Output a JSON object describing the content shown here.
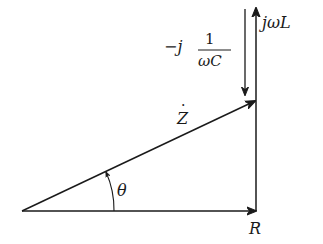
{
  "diagram": {
    "vectors": [
      {
        "id": "R",
        "label": "R",
        "description": "resistance along real axis"
      },
      {
        "id": "jwL",
        "label": "jωL",
        "description": "inductive reactance, upward"
      },
      {
        "id": "negj_wC",
        "label_prefix": "−j",
        "label_num": "1",
        "label_den": "ωC",
        "description": "capacitive reactance, downward"
      },
      {
        "id": "Z",
        "label": "Z",
        "label_accent": "·",
        "description": "impedance phasor (hypotenuse)"
      }
    ],
    "angle": {
      "label": "θ",
      "description": "impedance angle between R and Z"
    }
  }
}
